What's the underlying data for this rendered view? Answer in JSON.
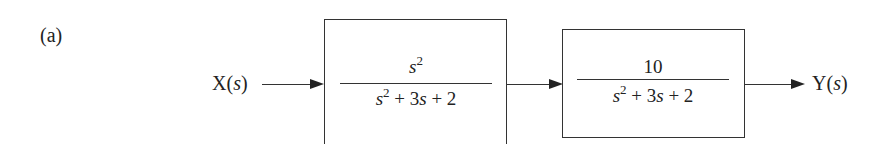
{
  "figure": {
    "label": "(a)",
    "input": {
      "name": "X",
      "var": "s"
    },
    "output": {
      "name": "Y",
      "var": "s"
    },
    "blocks": [
      {
        "numerator": {
          "base": "s",
          "exp": "2"
        },
        "denominator": {
          "base": "s",
          "exp": "2",
          "rest": " + 3",
          "var": "s",
          "tail": " + 2"
        }
      },
      {
        "numerator": {
          "text": "10"
        },
        "denominator": {
          "base": "s",
          "exp": "2",
          "rest": " + 3",
          "var": "s",
          "tail": " + 2"
        }
      }
    ]
  }
}
